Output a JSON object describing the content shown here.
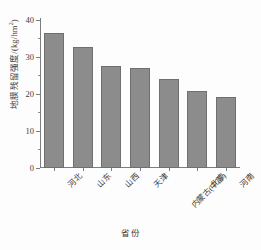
{
  "chart_data": {
    "type": "bar",
    "title": "",
    "subtitle": "",
    "xlabel": "省份",
    "ylabel": "地膜残留强度/(kg/hm²)",
    "ylabel_main": "地膜残留强度/(kg/hm",
    "ylabel_sup": "2",
    "ylabel_tail": ")",
    "categories": [
      "河北",
      "山东",
      "山西",
      "天津",
      "内蒙古(中部)",
      "北京",
      "河南"
    ],
    "values": [
      36.5,
      32.7,
      27.5,
      27.0,
      24.0,
      20.9,
      19.2
    ],
    "series": [
      {
        "name": "地膜残留强度",
        "values": [
          36.5,
          32.7,
          27.5,
          27.0,
          24.0,
          20.9,
          19.2
        ]
      }
    ],
    "ylim": [
      0,
      40
    ],
    "y_ticks": [
      0,
      10,
      20,
      30,
      40
    ],
    "y_tick_labels": [
      "0",
      "10",
      "20",
      "30",
      "40"
    ],
    "y_minor_ticks": [
      5,
      15,
      25,
      35
    ],
    "grid": false,
    "legend": null,
    "bar_color": "#8c8c8c",
    "bar_edge_color": "#6f6f6f",
    "axis_color": "#7d7d7d",
    "units": "kg/hm²"
  }
}
